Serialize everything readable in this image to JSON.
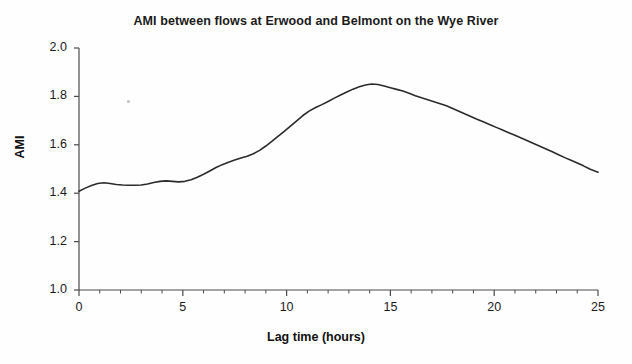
{
  "chart_data": {
    "type": "line",
    "title": "AMI between flows at Erwood and Belmont on the Wye River",
    "xlabel": "Lag time (hours)",
    "ylabel": "AMI",
    "xlim": [
      0,
      25
    ],
    "ylim": [
      1.0,
      2.0
    ],
    "grid": false,
    "legend": null,
    "x_ticks": [
      0,
      5,
      10,
      15,
      20,
      25
    ],
    "x_tick_labels": [
      "0",
      "5",
      "10",
      "15",
      "20",
      "25"
    ],
    "x_minor_tick_step": 1,
    "y_ticks": [
      1.0,
      1.2,
      1.4,
      1.6,
      1.8,
      2.0
    ],
    "y_tick_labels": [
      "1.0",
      "1.2",
      "1.4",
      "1.6",
      "1.8",
      "2.0"
    ],
    "line_color": "#2b2b2b",
    "line_width": 1.6,
    "series": [
      {
        "name": "AMI",
        "x": [
          0,
          0.3,
          0.6,
          0.9,
          1.2,
          1.5,
          1.8,
          2.1,
          2.4,
          2.7,
          3.0,
          3.3,
          3.6,
          3.9,
          4.2,
          4.5,
          4.8,
          5.1,
          5.4,
          5.7,
          6.0,
          6.3,
          6.6,
          6.9,
          7.2,
          7.5,
          7.8,
          8.1,
          8.4,
          8.7,
          9.0,
          9.3,
          9.6,
          9.9,
          10.2,
          10.5,
          10.8,
          11.1,
          11.4,
          11.7,
          12.0,
          12.3,
          12.6,
          12.9,
          13.2,
          13.5,
          13.8,
          14.1,
          14.4,
          14.7,
          15.0,
          15.3,
          15.6,
          15.9,
          16.2,
          16.5,
          16.8,
          17.1,
          17.4,
          17.7,
          18.0,
          18.3,
          18.6,
          18.9,
          19.2,
          19.5,
          19.8,
          20.1,
          20.4,
          20.7,
          21.0,
          21.3,
          21.6,
          21.9,
          22.2,
          22.5,
          22.8,
          23.1,
          23.4,
          23.7,
          24.0,
          24.3,
          24.6,
          25.0
        ],
        "values": [
          1.408,
          1.421,
          1.432,
          1.44,
          1.443,
          1.44,
          1.436,
          1.434,
          1.433,
          1.433,
          1.434,
          1.438,
          1.444,
          1.449,
          1.451,
          1.449,
          1.447,
          1.449,
          1.456,
          1.466,
          1.478,
          1.492,
          1.506,
          1.518,
          1.528,
          1.537,
          1.545,
          1.553,
          1.563,
          1.577,
          1.595,
          1.615,
          1.636,
          1.657,
          1.678,
          1.7,
          1.722,
          1.74,
          1.754,
          1.766,
          1.779,
          1.793,
          1.806,
          1.818,
          1.83,
          1.84,
          1.847,
          1.851,
          1.849,
          1.843,
          1.836,
          1.829,
          1.822,
          1.813,
          1.803,
          1.794,
          1.786,
          1.778,
          1.77,
          1.761,
          1.75,
          1.739,
          1.727,
          1.716,
          1.705,
          1.694,
          1.683,
          1.672,
          1.661,
          1.65,
          1.639,
          1.628,
          1.617,
          1.605,
          1.594,
          1.583,
          1.571,
          1.559,
          1.547,
          1.536,
          1.525,
          1.513,
          1.5,
          1.487
        ]
      }
    ],
    "annotations": [
      {
        "name": "scan-speck",
        "x_px": 127,
        "y_px": 100,
        "note": "faint scan artifact"
      }
    ]
  }
}
